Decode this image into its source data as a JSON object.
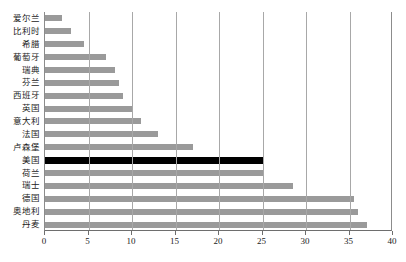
{
  "chart_data": {
    "type": "bar",
    "orientation": "horizontal",
    "title": "",
    "subtitle": "",
    "xlabel": "",
    "ylabel": "",
    "xlim": [
      0,
      40
    ],
    "xticks": [
      0,
      5,
      10,
      15,
      20,
      25,
      30,
      35,
      40
    ],
    "xtick_labels": [
      "0",
      "5",
      "10",
      "15",
      "20",
      "25",
      "30",
      "35",
      "40"
    ],
    "grid": true,
    "grid_axis": "x",
    "legend": null,
    "bar_color": "#9a9a9a",
    "highlight_color": "#000000",
    "highlight_category": "美国",
    "categories": [
      "爱尔兰",
      "比利时",
      "希腊",
      "葡萄牙",
      "瑞典",
      "芬兰",
      "西班牙",
      "英国",
      "意大利",
      "法国",
      "卢森堡",
      "美国",
      "荷兰",
      "瑞士",
      "德国",
      "奥地利",
      "丹麦"
    ],
    "values": [
      2,
      3,
      4.5,
      7,
      8,
      8.5,
      9,
      10,
      11,
      13,
      17,
      25,
      25,
      28.5,
      35.5,
      36,
      37
    ]
  }
}
